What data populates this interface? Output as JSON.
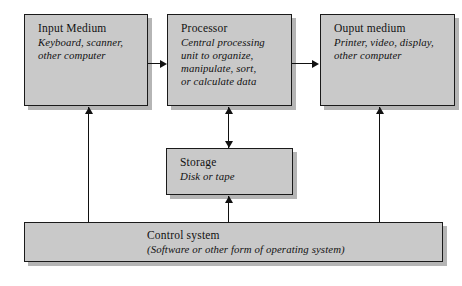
{
  "diagram": {
    "fill_color": "#c9c9c9",
    "border_color": "#1a1a1a",
    "background_color": "#ffffff",
    "nodes": [
      {
        "id": "input",
        "title": "Input Medium",
        "sub_line1": "Keyboard, scanner,",
        "sub_line2": "other computer"
      },
      {
        "id": "processor",
        "title": "Processor",
        "sub_line1": "Central processing",
        "sub_line2": "unit to organize,",
        "sub_line3": "manipulate, sort,",
        "sub_line4": "or calculate data"
      },
      {
        "id": "output",
        "title": "Ouput medium",
        "sub_line1": "Printer, video, display,",
        "sub_line2": "other computer"
      },
      {
        "id": "storage",
        "title": "Storage",
        "sub_line1": "Disk or tape"
      },
      {
        "id": "control",
        "title": "Control system",
        "sub_line1": "(Software or other form of operating system)"
      }
    ],
    "connectors": [
      {
        "id": "input-to-processor",
        "from": "input",
        "to": "processor",
        "direction": "right"
      },
      {
        "id": "processor-to-output",
        "from": "processor",
        "to": "output",
        "direction": "right"
      },
      {
        "id": "processor-storage",
        "from": "processor",
        "to": "storage",
        "direction": "both-vertical"
      },
      {
        "id": "control-to-input",
        "from": "control",
        "to": "input",
        "direction": "up"
      },
      {
        "id": "control-to-storage",
        "from": "control",
        "to": "storage",
        "direction": "up"
      },
      {
        "id": "control-to-output",
        "from": "control",
        "to": "output",
        "direction": "up"
      }
    ]
  }
}
